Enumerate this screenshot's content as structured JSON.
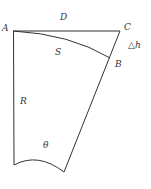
{
  "diagram": {
    "type": "geometry",
    "points": {
      "A": [
        13,
        31
      ],
      "C": [
        120,
        31
      ],
      "B": [
        110,
        58
      ],
      "BottomLeft": [
        14,
        165
      ],
      "BottomRight": [
        64,
        172
      ]
    },
    "labels": {
      "A": "A",
      "C": "C",
      "B": "B",
      "D": "D",
      "S": "S",
      "R": "R",
      "theta": "θ",
      "delta_h": "△h"
    },
    "line_color": "#333333"
  }
}
